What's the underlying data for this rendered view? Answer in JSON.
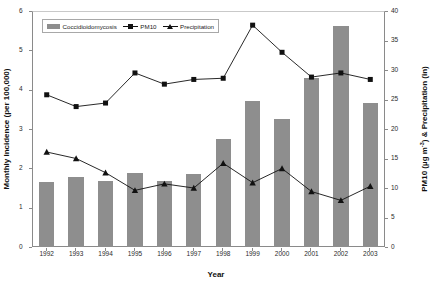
{
  "chart_data": {
    "type": "bar",
    "title": "",
    "xlabel": "Year",
    "ylabel": "Monthly Incidence (per 100,000)",
    "ylabel_right": "PM10 (µg m -3) & Precipitation (in)",
    "categories": [
      "1992",
      "1993",
      "1994",
      "1995",
      "1996",
      "1997",
      "1998",
      "1999",
      "2000",
      "2001",
      "2002",
      "2003"
    ],
    "ylim": [
      0,
      6
    ],
    "ylim_right": [
      0,
      40
    ],
    "yticks": [
      "0",
      "1",
      "2",
      "3",
      "4",
      "5",
      "6"
    ],
    "yticks_right": [
      "0",
      "5",
      "10",
      "15",
      "20",
      "25",
      "30",
      "35",
      "40"
    ],
    "grid": false,
    "legend_position": "top-left",
    "series": [
      {
        "name": "Coccidioidomycosis",
        "type": "bar",
        "axis": "left",
        "unit": "per 100,000",
        "color": "#8e8e8e",
        "values": [
          1.65,
          1.78,
          1.67,
          1.87,
          1.67,
          1.85,
          2.75,
          3.72,
          3.25,
          4.3,
          5.62,
          3.67
        ]
      },
      {
        "name": "PM10",
        "type": "line",
        "axis": "right",
        "unit": "µg m-3",
        "marker": "square",
        "color": "#111111",
        "values": [
          25.8,
          23.8,
          24.4,
          29.5,
          27.6,
          28.4,
          28.6,
          37.6,
          33.0,
          28.8,
          29.5,
          28.4
        ]
      },
      {
        "name": "Precipitation",
        "type": "line",
        "axis": "right",
        "unit": "in",
        "marker": "triangle",
        "color": "#111111",
        "values": [
          16.1,
          15.0,
          12.6,
          9.6,
          10.7,
          10.0,
          14.2,
          10.9,
          13.3,
          9.4,
          7.9,
          10.3
        ]
      }
    ]
  },
  "legend": {
    "items": [
      {
        "label": "Coccidioidomycosis",
        "marker": "bar-swatch"
      },
      {
        "label": "PM10",
        "marker": "line-square"
      },
      {
        "label": "Precipitation",
        "marker": "line-triangle"
      }
    ]
  },
  "axes": {
    "left_title": "Monthly Incidence (per 100,000)",
    "right_title_a": "PM10 (µg m",
    "right_title_sup": "-3",
    "right_title_b": ") & Precipitation (in)",
    "x_title": "Year"
  }
}
